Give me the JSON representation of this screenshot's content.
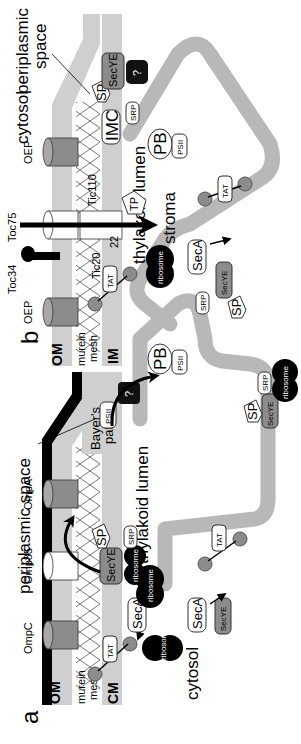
{
  "figure": {
    "orientation": "rotated-90-ccw",
    "colors": {
      "membrane_grey": "#c8c8c8",
      "lumen_grey": "#b4b4b4",
      "outer_membrane_black": "#000000",
      "protein_grey": "#8c8c8c",
      "ribosome_black": "#000000",
      "unknown_box": "#111111"
    }
  },
  "panel_a": {
    "letter": "a",
    "layers": {
      "om": "OM",
      "murein1": "murein",
      "murein2": "mesh",
      "cm": "CM"
    },
    "regions": {
      "periplasmic": "periplasmic space",
      "bayers1": "Bayer's",
      "bayers2": "patch",
      "cytosol": "cytosol",
      "lumen": "thylakoid lumen"
    },
    "porins": [
      "OmpC",
      "Omp85",
      "OmpA"
    ],
    "proteins": {
      "tat_cm": "TAT",
      "seca_1": "SecA",
      "seca_2": "SecA",
      "secye_cm": "SecYE",
      "secye_thy": "SecYE",
      "secye_bottom": "SecYE",
      "srp_1": "SRP",
      "srp_2": "SRP",
      "sp_1": "SP",
      "sp_2": "SP",
      "psii_1": "PSII",
      "psii_2": "PSII",
      "pb": "PB",
      "tat_thy": "TAT",
      "unknown": "?",
      "ribosome": "ribosome"
    }
  },
  "panel_b": {
    "letter": "b",
    "layers": {
      "om": "OM",
      "murein1": "murein",
      "murein2": "mesh",
      "im": "IM"
    },
    "regions": {
      "cytosol": "cytosol",
      "periplasmic1": "periplasmic",
      "periplasmic2": "space",
      "stroma": "stroma",
      "lumen": "thylakoid lumen"
    },
    "porins": {
      "oep_1": "OEP",
      "oep_2": "OEP"
    },
    "translocon": {
      "toc75": "Toc75",
      "toc34": "Toc34",
      "tic110": "Tic110",
      "tic20": "Tic20",
      "tic22": "22"
    },
    "proteins": {
      "tat_im": "TAT",
      "tat_thy": "TAT",
      "tp": "TP",
      "imc": "IMC",
      "sp_1": "SP",
      "sp_2": "SP",
      "secye_im": "SecYE",
      "secye_thy": "SecYE",
      "srp_1": "SRP",
      "srp_2": "SRP",
      "seca": "SecA",
      "pb": "PB",
      "psii": "PSII",
      "unknown": "?",
      "ribosome": "ribosome"
    }
  }
}
